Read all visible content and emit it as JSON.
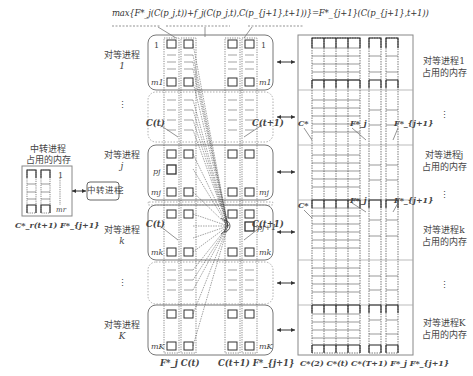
{
  "formula": "max{F*_j(C(p_j,t))+f_j(C(p_j,t),C(p_{j+1},t+1))}=F*_{j+1}(C(p_{j+1},t+1))",
  "left_group": {
    "rows": [
      {
        "label": "对等进程",
        "sub": "1"
      },
      {
        "label": "⋮",
        "sub": ""
      },
      {
        "label": "对等进程",
        "sub": "j"
      },
      {
        "label": "⋮",
        "sub": ""
      },
      {
        "label": "对等进程",
        "sub": "k"
      },
      {
        "label": "⋮",
        "sub": ""
      },
      {
        "label": "对等进程",
        "sub": "K"
      }
    ],
    "cell_labels": {
      "top": "1",
      "bottom_1": "m1",
      "p_j": "pj",
      "bottom_j": "mj",
      "bottom_k": "mk",
      "bottom_K": "mK",
      "p_j1": "pj+1"
    },
    "column_labels": [
      "C(t)",
      "C(t+1)",
      "C(t)",
      "C(t+1)"
    ],
    "bottom_labels": {
      "left": "F*_j C(t)",
      "right": "C(t+1) F*_{j+1}"
    }
  },
  "relay": {
    "title_line1": "中转进程",
    "title_line2": "占用的内存",
    "box_label": "中转进程",
    "top": "1",
    "bottom": "mr",
    "bottom_caption": "C*_r(t+1) F*_{j+1}"
  },
  "right_group": {
    "rows": [
      {
        "line1": "对等进程1",
        "line2": "占用的内存"
      },
      {
        "line1": "⋮",
        "line2": ""
      },
      {
        "line1": "对等进程j",
        "line2": "占用的内存"
      },
      {
        "line1": "⋮",
        "line2": ""
      },
      {
        "line1": "对等进程k",
        "line2": "占用的内存"
      },
      {
        "line1": "⋮",
        "line2": ""
      },
      {
        "line1": "对等进程K",
        "line2": "占用的内存"
      }
    ],
    "annotations": [
      "C*",
      "F*_j",
      "F*_{j+1}",
      "C*",
      "F*_j",
      "F*_{j+1}"
    ],
    "bottom_caption": "C*(2) C*(t) C*(T+1) F*_j F*_{j+1}"
  },
  "arrows": {
    "symbol": "↔"
  }
}
